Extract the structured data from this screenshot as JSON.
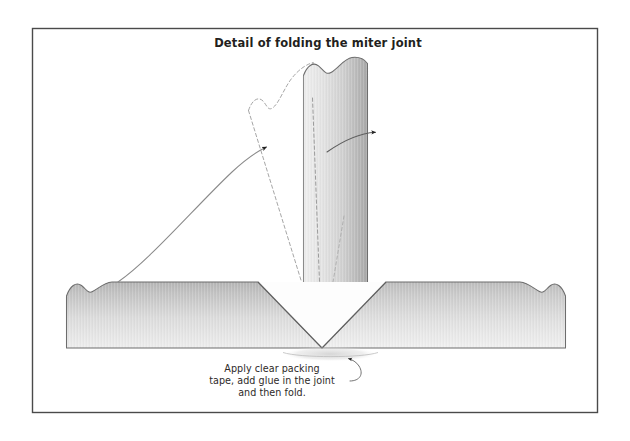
{
  "figure": {
    "title": "Detail of folding the miter joint",
    "caption_lines": [
      "Apply clear packing",
      "tape, add glue in the joint",
      "and then fold."
    ],
    "frame": {
      "x": 32,
      "y": 28,
      "width": 566,
      "height": 385,
      "border_color": "#4a4a4a",
      "fill_color": "#ffffff"
    },
    "colors": {
      "outline": "#555555",
      "board_light": "#f2f2f2",
      "board_mid": "#d2d2d2",
      "board_dark": "#a9a9a9",
      "dashed_ghost": "#9a9a9a",
      "arrow": "#7b7b7b",
      "arrow_dark": "#2b2b2b",
      "title_text": "#231f20",
      "caption_text": "#2e2a28",
      "glue_highlight": "#d9d9d9"
    },
    "parts": [
      {
        "name": "left-horizontal-board",
        "label": "Left board with mitered end",
        "x_range": [
          66,
          322
        ],
        "y_range": [
          282,
          348
        ]
      },
      {
        "name": "right-horizontal-board",
        "label": "Right board with mitered end",
        "x_range": [
          322,
          566
        ],
        "y_range": [
          282,
          348
        ]
      },
      {
        "name": "vertical-folded-board",
        "label": "Folded up board",
        "x_range": [
          303,
          368
        ],
        "y_range": [
          62,
          348
        ]
      },
      {
        "name": "ghost-unfolded-board",
        "label": "Dashed outline of unfolded position",
        "x_range": [
          248,
          322
        ],
        "y_range": [
          70,
          348
        ]
      }
    ],
    "annotations": [
      {
        "name": "fold-sweep-arrow",
        "from": [
          118,
          282
        ],
        "to": [
          270,
          148
        ],
        "description": "Long curved arrow from left board surface to unfolded panel"
      },
      {
        "name": "fold-direction-arrow",
        "from": [
          330,
          150
        ],
        "to": [
          381,
          132
        ],
        "description": "Short curved arrow showing fold rotation at top right"
      },
      {
        "name": "caption-leader-line",
        "from": [
          300,
          378
        ],
        "to": [
          330,
          357
        ],
        "description": "Leader line from caption to glue joint"
      }
    ]
  }
}
